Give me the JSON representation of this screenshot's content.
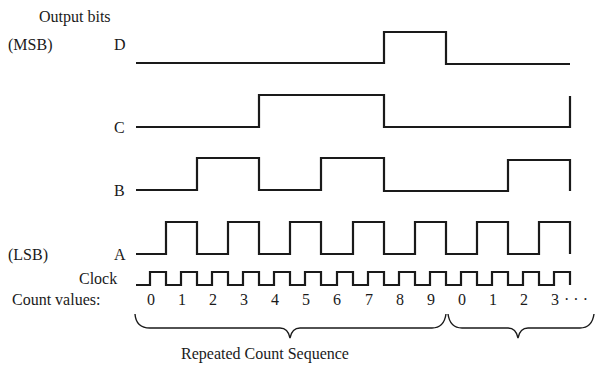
{
  "title": "Output bits",
  "signals": [
    {
      "name": "D",
      "tag": "(MSB)",
      "label": "D"
    },
    {
      "name": "C",
      "tag": "",
      "label": "C"
    },
    {
      "name": "B",
      "tag": "",
      "label": "B"
    },
    {
      "name": "A",
      "tag": "(LSB)",
      "label": "A"
    }
  ],
  "clock_label": "Clock",
  "count_label": "Count values:",
  "count_values": [
    "0",
    "1",
    "2",
    "3",
    "4",
    "5",
    "6",
    "7",
    "8",
    "9",
    "0",
    "1",
    "2",
    "3"
  ],
  "ellipsis": "· · ·",
  "brace_label": "Repeated Count Sequence",
  "line_color": "#1a1a1a"
}
